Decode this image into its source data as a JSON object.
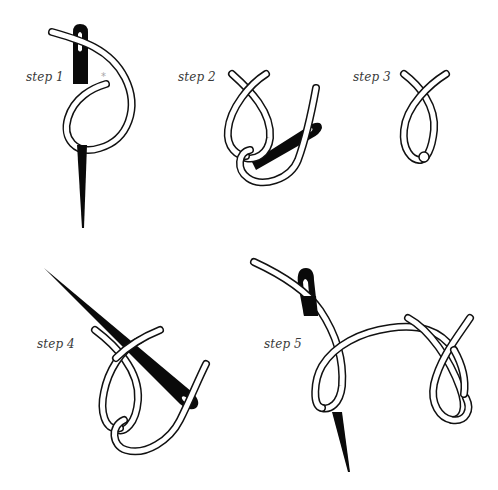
{
  "steps": [
    {
      "id": 1,
      "label": "step 1",
      "marker": "*"
    },
    {
      "id": 2,
      "label": "step 2"
    },
    {
      "id": 3,
      "label": "step 3"
    },
    {
      "id": 4,
      "label": "step 4"
    },
    {
      "id": 5,
      "label": "step 5"
    }
  ],
  "colors": {
    "background": "#ffffff",
    "outline": "#111111",
    "thread_fill": "#ffffff",
    "needle": "#0a0a0a",
    "label_text": "#3a3a3a",
    "marker": "#a8a8a8"
  }
}
